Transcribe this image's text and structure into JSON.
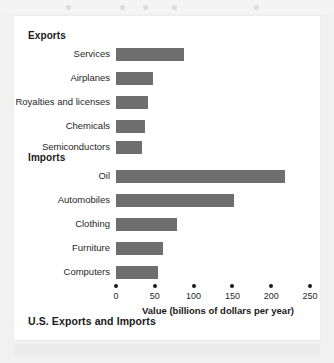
{
  "figure": {
    "title": "U.S. Exports and Imports",
    "axis_caption": "Value (billions of dollars per year)",
    "section_headings": {
      "exports": "Exports",
      "imports": "Imports"
    },
    "bar_color": "#6e6e6e",
    "background_color": "#ffffff",
    "page_color": "#f1f1f1",
    "text_color": "#1a1a1a"
  },
  "chart_data": {
    "type": "bar",
    "orientation": "horizontal",
    "title": "U.S. Exports and Imports",
    "xlabel": "Value (billions of dollars per year)",
    "ylabel": "",
    "xlim": [
      0,
      250
    ],
    "xticks": [
      0,
      50,
      100,
      150,
      200,
      250
    ],
    "xtick_labels": [
      "0",
      "50",
      "100",
      "150",
      "200",
      "250"
    ],
    "grid": false,
    "legend": false,
    "units": "billions of dollars per year",
    "groups": [
      {
        "name": "Exports",
        "categories": [
          "Services",
          "Airplanes",
          "Royalties and licenses",
          "Chemicals",
          "Semiconductors"
        ],
        "values": [
          87,
          48,
          41,
          37,
          34
        ]
      },
      {
        "name": "Imports",
        "categories": [
          "Oil",
          "Automobiles",
          "Clothing",
          "Furniture",
          "Computers"
        ],
        "values": [
          218,
          152,
          78,
          61,
          54
        ]
      }
    ],
    "categories": [
      "Services",
      "Airplanes",
      "Royalties and licenses",
      "Chemicals",
      "Semiconductors",
      "Oil",
      "Automobiles",
      "Clothing",
      "Furniture",
      "Computers"
    ],
    "values": [
      87,
      48,
      41,
      37,
      34,
      218,
      152,
      78,
      61,
      54
    ]
  }
}
